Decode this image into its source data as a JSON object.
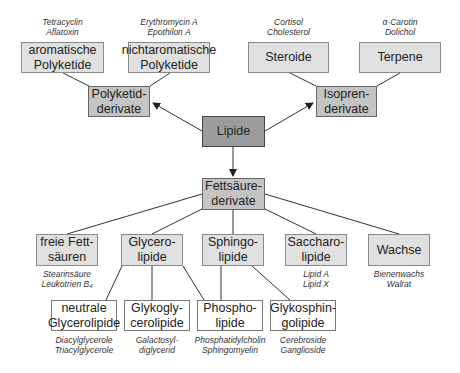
{
  "root": {
    "label": "Lipide"
  },
  "level1": [
    {
      "id": "polyketid",
      "label": "Polyketid-\nderivate"
    },
    {
      "id": "isopren",
      "label": "Isopren-\nderivate"
    },
    {
      "id": "fettsaeure",
      "label": "Fettsäure-\nderivate"
    }
  ],
  "polyketid_children": [
    {
      "label": "aromatische\nPolyketide",
      "examples": "Tetracyclin\nAflatoxin"
    },
    {
      "label": "nichtaromatische\nPolyketide",
      "examples": "Erythromycin A\nEpothilon A"
    }
  ],
  "isopren_children": [
    {
      "label": "Steroide",
      "examples": "Cortisol\nCholesterol"
    },
    {
      "label": "Terpene",
      "examples": "α-Carotin\nDolichol"
    }
  ],
  "fettsaeure_children": [
    {
      "label": "freie Fett-\nsäuren",
      "examples": "Stearinsäure\nLeukotrien B₄"
    },
    {
      "label": "Glycero-\nlipide",
      "examples": ""
    },
    {
      "label": "Sphingo-\nlipide",
      "examples": ""
    },
    {
      "label": "Saccharo-\nlipide",
      "examples": "Lipid A\nLipid X"
    },
    {
      "label": "Wachse",
      "examples": "Bienenwachs\nWalrat"
    }
  ],
  "level4": [
    {
      "label": "neutrale\nGlycerolipide",
      "examples": "Diacylglycerole\nTriacylglycerole"
    },
    {
      "label": "Glykogly-\ncerolipide",
      "examples": "Galactosyl-\ndiglycerid"
    },
    {
      "label": "Phospho-\nlipide",
      "examples": "Phosphatidylcholin\nSphingomyelin"
    },
    {
      "label": "Glykosphin-\ngolipide",
      "examples": "Cerebroside\nGanglioside"
    }
  ],
  "colors": {
    "root": "#9c9c9c",
    "level1": "#c4c4c4",
    "level2": "#e0e0e0",
    "level4": "#ffffff",
    "line": "#333333"
  }
}
